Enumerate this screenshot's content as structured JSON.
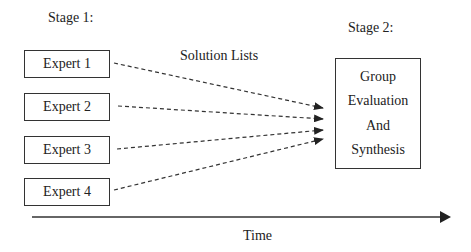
{
  "stage1": {
    "label": "Stage 1:"
  },
  "stage2": {
    "label": "Stage 2:"
  },
  "experts": [
    {
      "label": "Expert 1"
    },
    {
      "label": "Expert 2"
    },
    {
      "label": "Expert 3"
    },
    {
      "label": "Expert 4"
    }
  ],
  "arrows_label": "Solution Lists",
  "group_box": {
    "lines": [
      "Group",
      "Evaluation",
      "And",
      "Synthesis"
    ]
  },
  "time_axis": {
    "label": "Time"
  }
}
